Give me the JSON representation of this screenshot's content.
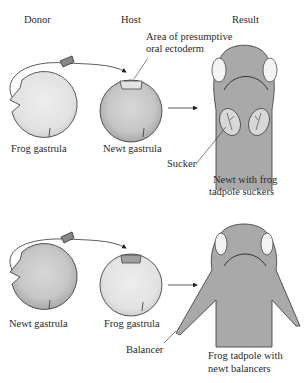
{
  "headers": {
    "donor": "Donor",
    "host": "Host",
    "result": "Result"
  },
  "top_row": {
    "donor_label": "Frog gastrula",
    "host_label": "Newt gastrula",
    "area_label_line1": "Area of presumptive",
    "area_label_line2": "oral ectoderm",
    "sucker_label": "Sucker",
    "result_label_line1": "Newt with frog",
    "result_label_line2": "tadpole suckers"
  },
  "bottom_row": {
    "donor_label": "Newt gastrula",
    "host_label": "Frog gastrula",
    "balancer_label": "Balancer",
    "result_label_line1": "Frog tadpole with",
    "result_label_line2": "newt balancers"
  },
  "colors": {
    "frog_gastrula": "#e6e6e6",
    "newt_gastrula": "#c4c4c4",
    "embryo": "#a9a9a9",
    "outline": "#333333"
  }
}
